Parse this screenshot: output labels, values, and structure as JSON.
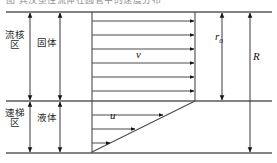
{
  "figure": {
    "title_fragment": "图 宾汉塑性流体在圆管中的速度分布",
    "width": 277,
    "height": 163,
    "background": "#ffffff",
    "line_color": "#3a3a3a",
    "zones": {
      "upper_left_label": "流核区",
      "lower_left_label": "速梯区",
      "upper_state_label": "固体",
      "lower_state_label": "液体"
    },
    "symbols": {
      "plug_velocity": "v",
      "shear_velocity": "u",
      "plug_radius": "r",
      "plug_radius_sub": "0",
      "pipe_radius": "R"
    },
    "geometry": {
      "top_line_y": 12,
      "mid_line_y": 101,
      "bottom_line_y": 153,
      "axis_x": 92,
      "plug_right_x": 195,
      "dim_x_zone": 30,
      "dim_x_state": 60,
      "dim_x_r0": 222,
      "dim_x_R": 250,
      "plug_arrow_count": 6,
      "shear_arrow_count": 3,
      "plug_arrow_y": [
        21,
        35,
        49,
        63,
        77,
        91
      ],
      "shear_arrows": [
        {
          "y": 115,
          "tip_x": 163
        },
        {
          "y": 129,
          "tip_x": 135
        },
        {
          "y": 143,
          "tip_x": 110
        }
      ]
    }
  }
}
